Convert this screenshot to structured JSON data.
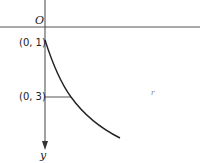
{
  "diagram": {
    "labels": {
      "origin": "O",
      "point_a": "(0, 1)",
      "point_b": "(0, 3)",
      "y_axis": "y",
      "curve_label": "r"
    },
    "colors": {
      "line": "#222222",
      "axis": "#555555",
      "background": "#ffffff"
    },
    "geometry": {
      "x_axis_y": 27,
      "y_axis_x": 45,
      "curve_start": [
        45,
        40
      ],
      "curve_mid": [
        71,
        97
      ],
      "curve_end": [
        120,
        138
      ]
    }
  }
}
